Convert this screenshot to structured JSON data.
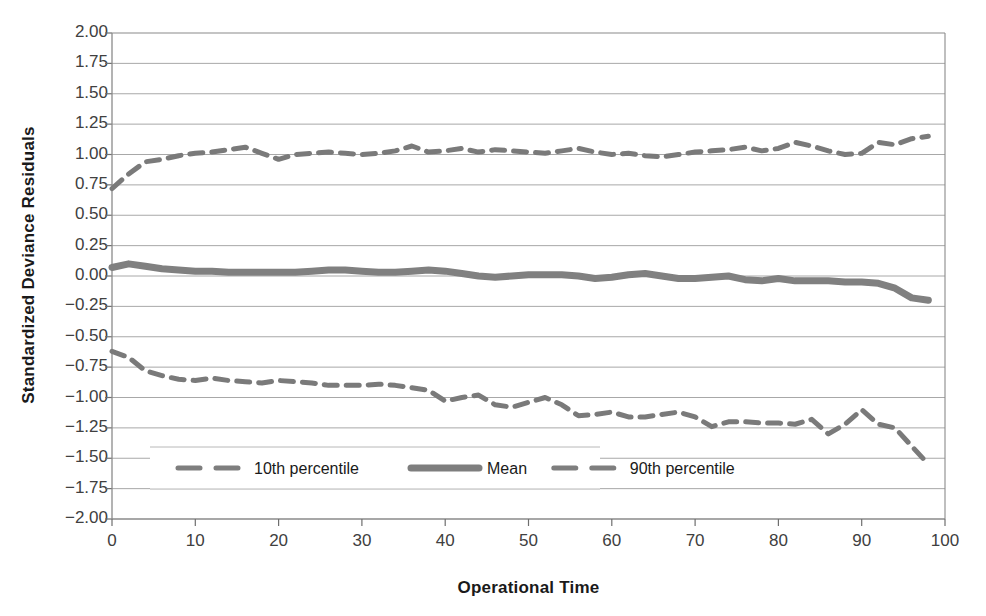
{
  "chart_data": {
    "type": "line",
    "title": "",
    "xlabel": "Operational Time",
    "ylabel": "Standardized Deviance Residuals",
    "xlim": [
      0,
      100
    ],
    "ylim": [
      -2.0,
      2.0
    ],
    "grid": true,
    "legend_position": "inside-bottom-center",
    "x_ticks": [
      "0",
      "10",
      "20",
      "30",
      "40",
      "50",
      "60",
      "70",
      "80",
      "90",
      "100"
    ],
    "y_ticks": [
      "2.00",
      "1.75",
      "1.50",
      "1.25",
      "1.00",
      "0.75",
      "0.50",
      "0.25",
      "0.00",
      "-0.25",
      "-0.50",
      "-0.75",
      "-1.00",
      "-1.25",
      "-1.50",
      "-1.75",
      "-2.00"
    ],
    "series": [
      {
        "name": "10th percentile",
        "style": "dashed",
        "color": "#7a7a7a",
        "x": [
          0,
          2,
          4,
          6,
          8,
          10,
          12,
          14,
          16,
          18,
          20,
          22,
          24,
          26,
          28,
          30,
          32,
          34,
          36,
          38,
          40,
          42,
          44,
          46,
          48,
          50,
          52,
          54,
          56,
          58,
          60,
          62,
          64,
          66,
          68,
          70,
          72,
          74,
          76,
          78,
          80,
          82,
          84,
          86,
          88,
          90,
          92,
          94,
          96,
          98
        ],
        "values": [
          -0.62,
          -0.67,
          -0.78,
          -0.82,
          -0.85,
          -0.86,
          -0.84,
          -0.86,
          -0.87,
          -0.88,
          -0.86,
          -0.87,
          -0.88,
          -0.9,
          -0.9,
          -0.9,
          -0.89,
          -0.9,
          -0.92,
          -0.94,
          -1.03,
          -1.0,
          -0.98,
          -1.06,
          -1.08,
          -1.04,
          -1.0,
          -1.06,
          -1.15,
          -1.14,
          -1.12,
          -1.16,
          -1.16,
          -1.14,
          -1.12,
          -1.16,
          -1.24,
          -1.2,
          -1.2,
          -1.21,
          -1.21,
          -1.22,
          -1.18,
          -1.3,
          -1.22,
          -1.1,
          -1.22,
          -1.25,
          -1.4,
          -1.55
        ]
      },
      {
        "name": "Mean",
        "style": "solid",
        "color": "#808080",
        "x": [
          0,
          2,
          4,
          6,
          8,
          10,
          12,
          14,
          16,
          18,
          20,
          22,
          24,
          26,
          28,
          30,
          32,
          34,
          36,
          38,
          40,
          42,
          44,
          46,
          48,
          50,
          52,
          54,
          56,
          58,
          60,
          62,
          64,
          66,
          68,
          70,
          72,
          74,
          76,
          78,
          80,
          82,
          84,
          86,
          88,
          90,
          92,
          94,
          96,
          98
        ],
        "values": [
          0.07,
          0.1,
          0.08,
          0.06,
          0.05,
          0.04,
          0.04,
          0.03,
          0.03,
          0.03,
          0.03,
          0.03,
          0.04,
          0.05,
          0.05,
          0.04,
          0.03,
          0.03,
          0.04,
          0.05,
          0.04,
          0.02,
          0.0,
          -0.01,
          0.0,
          0.01,
          0.01,
          0.01,
          0.0,
          -0.02,
          -0.01,
          0.01,
          0.02,
          0.0,
          -0.02,
          -0.02,
          -0.01,
          0.0,
          -0.03,
          -0.04,
          -0.02,
          -0.04,
          -0.04,
          -0.04,
          -0.05,
          -0.05,
          -0.06,
          -0.1,
          -0.18,
          -0.2
        ]
      },
      {
        "name": "90th percentile",
        "style": "dashed",
        "color": "#7a7a7a",
        "x": [
          0,
          2,
          4,
          6,
          8,
          10,
          12,
          14,
          16,
          18,
          20,
          22,
          24,
          26,
          28,
          30,
          32,
          34,
          36,
          38,
          40,
          42,
          44,
          46,
          48,
          50,
          52,
          54,
          56,
          58,
          60,
          62,
          64,
          66,
          68,
          70,
          72,
          74,
          76,
          78,
          80,
          82,
          84,
          86,
          88,
          90,
          92,
          94,
          96,
          98
        ],
        "values": [
          0.72,
          0.84,
          0.94,
          0.96,
          0.99,
          1.01,
          1.02,
          1.04,
          1.06,
          1.01,
          0.96,
          1.0,
          1.01,
          1.02,
          1.01,
          1.0,
          1.01,
          1.03,
          1.07,
          1.02,
          1.03,
          1.05,
          1.02,
          1.04,
          1.03,
          1.02,
          1.01,
          1.03,
          1.05,
          1.02,
          1.0,
          1.01,
          0.99,
          0.98,
          1.0,
          1.02,
          1.03,
          1.04,
          1.06,
          1.03,
          1.05,
          1.1,
          1.07,
          1.03,
          1.0,
          1.01,
          1.1,
          1.08,
          1.13,
          1.15
        ]
      }
    ]
  },
  "legend": {
    "items": [
      {
        "label": "10th percentile",
        "style": "dashed"
      },
      {
        "label": "Mean",
        "style": "solid"
      },
      {
        "label": "90th percentile",
        "style": "dashed"
      }
    ]
  },
  "axes": {
    "x_title": "Operational Time",
    "y_title": "Standardized Deviance Residuals"
  }
}
